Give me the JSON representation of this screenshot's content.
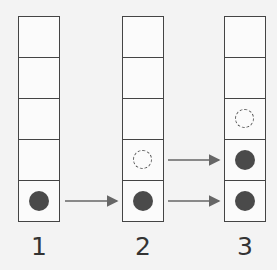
{
  "columns": [
    {
      "label": "1",
      "cells": [
        "empty",
        "empty",
        "empty",
        "empty",
        "filled"
      ]
    },
    {
      "label": "2",
      "cells": [
        "empty",
        "empty",
        "empty",
        "ghost",
        "filled"
      ]
    },
    {
      "label": "3",
      "cells": [
        "empty",
        "empty",
        "ghost",
        "filled",
        "filled"
      ]
    }
  ],
  "arrows": [
    {
      "from": "column-1-row-5",
      "to": "column-2-row-5"
    },
    {
      "from": "column-2-row-4",
      "to": "column-3-row-4"
    },
    {
      "from": "column-2-row-5",
      "to": "column-3-row-5"
    }
  ],
  "colors": {
    "line": "#444444",
    "dot": "#4a4a4a",
    "arrow": "#666666",
    "background": "#f3f3f3"
  }
}
